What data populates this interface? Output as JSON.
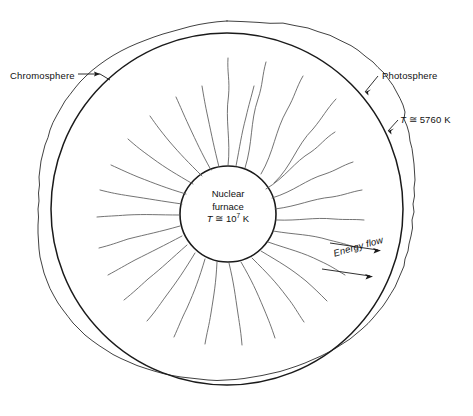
{
  "figure": {
    "background_color": "#ffffff",
    "line_color": "#1a1a1a",
    "streak_color": "#555555"
  },
  "labels": {
    "chromosphere": "Chromosphere",
    "photosphere": "Photosphere",
    "surface_temperature": "T ≅ 5760 K",
    "surface_temperature_symbol": "T",
    "surface_temperature_value": "≅ 5760 K",
    "energy_flow": "Energy flow"
  },
  "core": {
    "line1": "Nuclear",
    "line2": "furnace",
    "temperature_symbol": "T",
    "temperature_prefix": "≅ 10",
    "temperature_exponent": "7",
    "temperature_unit": "K"
  },
  "annotations": {
    "chromosphere_arrow": "arrow-right-icon",
    "photosphere_leader": "leader-line-icon",
    "surface_temperature_leader": "leader-line-icon",
    "energy_flow_arrow_upper": "arrow-right-icon",
    "energy_flow_arrow_lower": "arrow-right-icon"
  },
  "geometry": {
    "photosphere_center_x": 227,
    "photosphere_center_y": 209,
    "photosphere_radius": 176,
    "chromosphere_radius": 188,
    "core_center_x": 228,
    "core_center_y": 214,
    "core_radius": 48,
    "convection_streak_count": 28
  }
}
